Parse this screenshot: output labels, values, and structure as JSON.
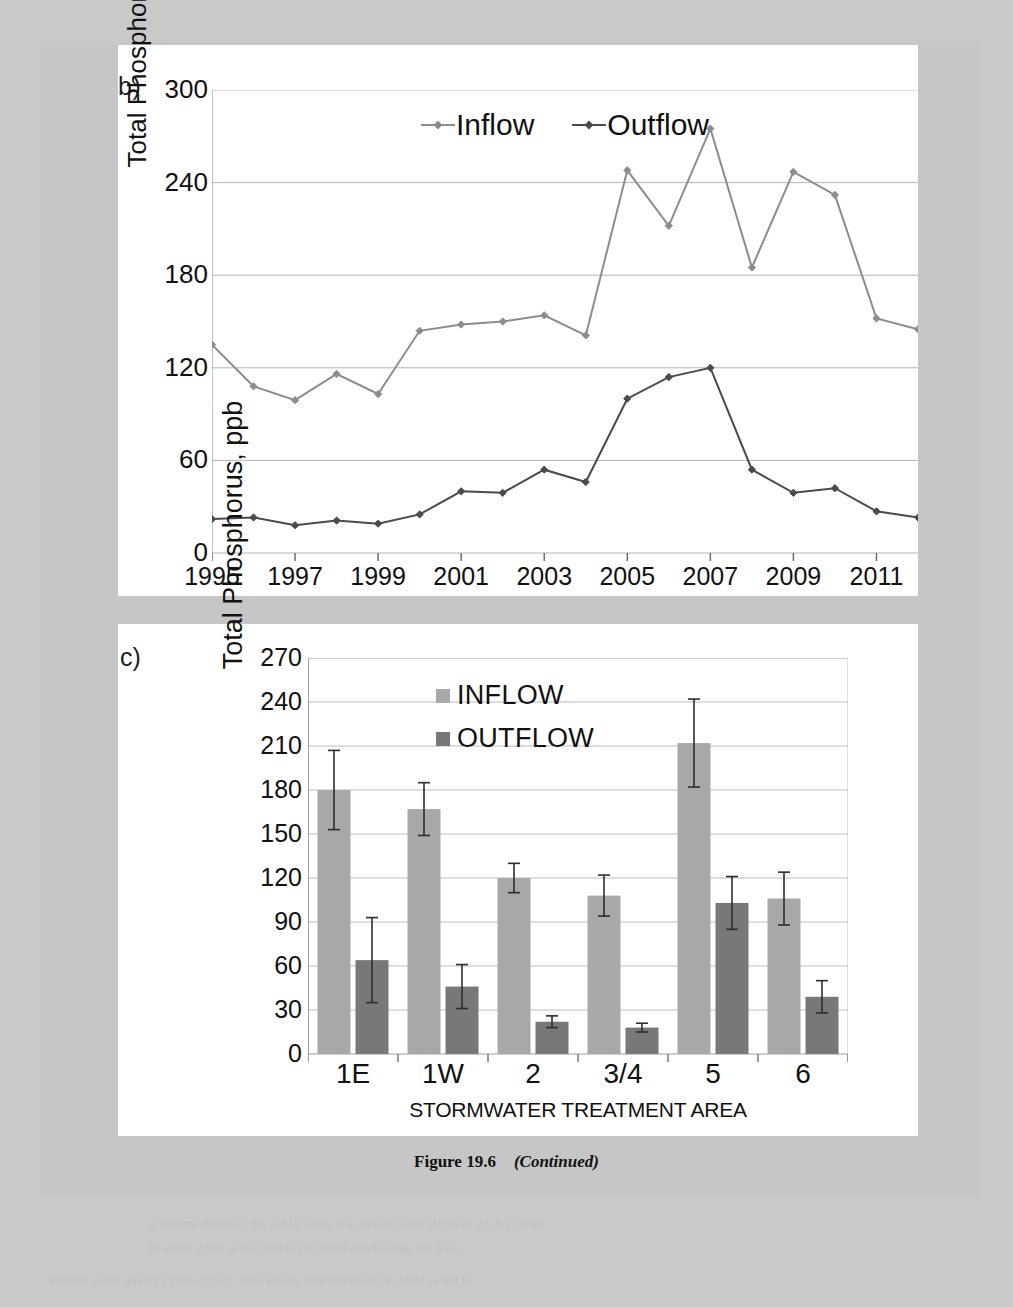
{
  "page": {
    "caption_figure": "Figure 19.6",
    "caption_continued": "(Continued)",
    "panel_b_label": "b)",
    "panel_c_label": "c)"
  },
  "bleed_lines": [
    "a vertical distance; the actual value is a surface water depth of 2.6 ft (0.8 m)",
    "to about 2,000 acres (809 ha) to avoid overloading the STA",
    "influent water quality (1995–2012). Total inflow concentrations, in units as not to"
  ],
  "chart_data": [
    {
      "id": "panel-b",
      "type": "line",
      "title": "",
      "xlabel": "",
      "ylabel": "Total Phosphorus, ppb",
      "xlim": [
        1995,
        2012
      ],
      "ylim": [
        0,
        300
      ],
      "yticks": [
        0,
        60,
        120,
        180,
        240,
        300
      ],
      "xticks": [
        1995,
        1997,
        1999,
        2001,
        2003,
        2005,
        2007,
        2009,
        2011
      ],
      "grid": true,
      "legend_position": "top-center",
      "x": [
        1995,
        1996,
        1997,
        1998,
        1999,
        2000,
        2001,
        2002,
        2003,
        2004,
        2005,
        2006,
        2007,
        2008,
        2009,
        2010,
        2011,
        2012
      ],
      "series": [
        {
          "name": "Inflow",
          "color": "#8c8c8c",
          "marker": "diamond",
          "values": [
            135,
            108,
            99,
            116,
            103,
            144,
            148,
            150,
            154,
            141,
            248,
            212,
            275,
            185,
            247,
            232,
            152,
            145
          ]
        },
        {
          "name": "Outflow",
          "color": "#4a4a4a",
          "marker": "diamond",
          "values": [
            22,
            23,
            18,
            21,
            19,
            25,
            40,
            39,
            54,
            46,
            100,
            114,
            120,
            54,
            39,
            42,
            27,
            23
          ]
        }
      ]
    },
    {
      "id": "panel-c",
      "type": "bar",
      "title": "",
      "xlabel": "STORMWATER TREATMENT AREA",
      "ylabel": "Total Phosphorus, ppb",
      "ylim": [
        0,
        270
      ],
      "yticks": [
        0,
        30,
        60,
        90,
        120,
        150,
        180,
        210,
        240,
        270
      ],
      "categories": [
        "1E",
        "1W",
        "2",
        "3/4",
        "5",
        "6"
      ],
      "grid": true,
      "legend_position": "top-center",
      "series": [
        {
          "name": "INFLOW",
          "color": "#a8a8a8",
          "values": [
            180,
            167,
            120,
            108,
            212,
            106
          ],
          "errors": [
            27,
            18,
            10,
            14,
            30,
            18
          ]
        },
        {
          "name": "OUTFLOW",
          "color": "#787878",
          "values": [
            64,
            46,
            22,
            18,
            103,
            39
          ],
          "errors": [
            29,
            15,
            4,
            3,
            18,
            11
          ]
        }
      ]
    }
  ]
}
